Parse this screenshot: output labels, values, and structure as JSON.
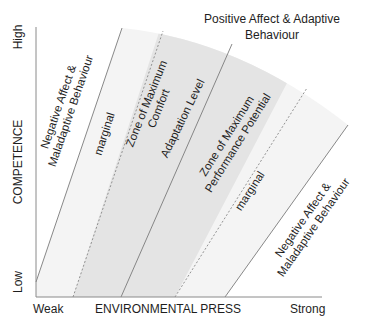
{
  "diagram": {
    "type": "ecological-model-of-aging",
    "y_axis": {
      "label": "COMPETENCE",
      "high_label": "High",
      "low_label": "Low"
    },
    "x_axis": {
      "label": "ENVIRONMENTAL PRESS",
      "weak_label": "Weak",
      "strong_label": "Strong"
    },
    "top_label": {
      "line1": "Positive Affect & Adaptive",
      "line2": "Behaviour"
    },
    "zones": [
      {
        "id": "negative-left",
        "line1": "Negative Affect &",
        "line2": "Maladaptive Behaviour"
      },
      {
        "id": "marginal-left",
        "line1": "marginal"
      },
      {
        "id": "max-comfort",
        "line1": "Zone of Maximum",
        "line2": "Comfort"
      },
      {
        "id": "adaptation-level",
        "line1": "Adaptation Level"
      },
      {
        "id": "max-performance",
        "line1": "Zone of Maximum",
        "line2": "Performance Potential"
      },
      {
        "id": "marginal-right",
        "line1": "marginal"
      },
      {
        "id": "negative-right",
        "line1": "Negative Affect &",
        "line2": "Maladaptive Behaviour"
      }
    ],
    "colors": {
      "outer_band": "#f3f3f3",
      "inner_band": "#e6e6e6",
      "line": "#7a7a7a",
      "axis": "#8a8a8a"
    }
  }
}
